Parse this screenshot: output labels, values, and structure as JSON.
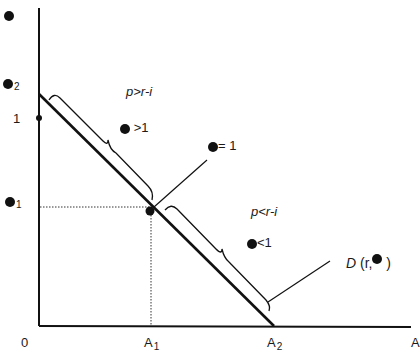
{
  "diagram": {
    "type": "economic-demand-diagram",
    "axes": {
      "origin_label": "0",
      "x_axis_end_label": "A",
      "x_ticks": [
        {
          "label": "A",
          "subscript": "1"
        },
        {
          "label": "A",
          "subscript": "2"
        }
      ],
      "y_top_symbol": "●",
      "y_labels": [
        {
          "symbol": "●",
          "subscript": "2"
        },
        {
          "symbol": "",
          "text": "1"
        },
        {
          "symbol": "●",
          "subscript": "1"
        }
      ]
    },
    "regions": {
      "upper": {
        "condition": "p>r-i",
        "marker_symbol": "●",
        "marker_text": ">1"
      },
      "lower": {
        "condition": "p<r-i",
        "marker_symbol": "●",
        "marker_text": "<1"
      }
    },
    "point_label": {
      "marker_symbol": "●",
      "text": "= 1"
    },
    "demand_curve": {
      "label_prefix": "D",
      "label_args": "(r,",
      "label_symbol": "●",
      "label_close": ")"
    },
    "colors": {
      "ink": "#111111",
      "background": "#ffffff"
    }
  }
}
